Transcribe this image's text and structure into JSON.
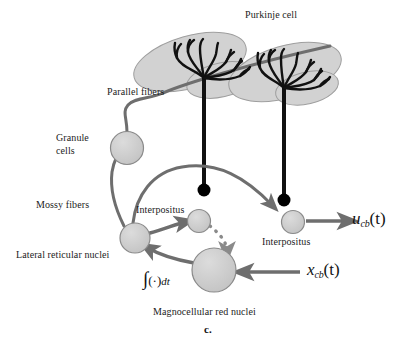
{
  "figure": {
    "panel_letter": "c.",
    "width": 412,
    "height": 344,
    "background": "#ffffff"
  },
  "colors": {
    "dendrite_fill": "#d2d2d2",
    "dendrite_stroke": "#9a9a9a",
    "neuron_fill": "#c9c9c9",
    "neuron_stroke": "#7a7a7a",
    "branch_stroke": "#111111",
    "axon_stroke": "#111111",
    "pathway_gray": "#6e6e6e",
    "terminal_black": "#000000",
    "text": "#1c1c1c"
  },
  "labels": {
    "purkinje_cell": "Purkinje cell",
    "parallel_fibers": "Parallel fibers",
    "granule_cells_line1": "Granule",
    "granule_cells_line2": "cells",
    "mossy_fibers": "Mossy fibers",
    "interpositus_left": "Interpositus",
    "interpositus_right": "Interpositus",
    "lateral_reticular_nuclei": "Lateral reticular nuclei",
    "magnocellular_red_nuclei": "Magnocellular red nuclei"
  },
  "math": {
    "output_signal_var": "u",
    "output_signal_sub": "cb",
    "output_signal_arg": "(t)",
    "input_signal_var": "x",
    "input_signal_sub": "cb",
    "input_signal_arg": "(t)",
    "integrator_prefix": "∫",
    "integrator_body": "(·)",
    "integrator_suffix": "dt"
  },
  "nodes": [
    {
      "id": "granule-cell",
      "label": "Granule cells",
      "cx": 127,
      "cy": 148,
      "r": 16.5
    },
    {
      "id": "lateral-reticular-nucleus",
      "label": "Lateral reticular nuclei",
      "cx": 135,
      "cy": 238,
      "r": 15
    },
    {
      "id": "interpositus-left",
      "label": "Interpositus",
      "cx": 199,
      "cy": 221,
      "r": 11.5
    },
    {
      "id": "interpositus-right",
      "label": "Interpositus",
      "cx": 293,
      "cy": 222,
      "r": 11.5
    },
    {
      "id": "magnocellular-red-nucleus",
      "label": "Magnocellular red nuclei",
      "cx": 214,
      "cy": 270,
      "r": 22
    },
    {
      "id": "purkinje-soma-left",
      "label": "Purkinje cell soma (left)",
      "cx": 204,
      "cy": 190,
      "r": 6
    },
    {
      "id": "purkinje-soma-right",
      "label": "Purkinje cell soma (right)",
      "cx": 284,
      "cy": 200,
      "r": 6
    }
  ],
  "connections": [
    {
      "id": "parallel-fiber",
      "from": "granule-cell",
      "to": "purkinje-dendrites",
      "style": "solid-gray"
    },
    {
      "id": "mossy-fiber-to-granule",
      "from": "lateral-reticular-nucleus",
      "to": "granule-cell",
      "style": "solid-gray"
    },
    {
      "id": "mossy-fiber-to-interpositus-right",
      "from": "lateral-reticular-nucleus",
      "to": "interpositus-right",
      "style": "solid-gray-arrow"
    },
    {
      "id": "lrn-to-interpositus-left",
      "from": "lateral-reticular-nucleus",
      "to": "interpositus-left",
      "style": "solid-gray-arrow"
    },
    {
      "id": "interpositus-left-to-red-nucleus",
      "from": "interpositus-left",
      "to": "magnocellular-red-nucleus",
      "style": "dotted-gray-arrow"
    },
    {
      "id": "red-nucleus-to-lrn",
      "from": "magnocellular-red-nucleus",
      "to": "lateral-reticular-nucleus",
      "style": "solid-gray-arrow"
    },
    {
      "id": "input-to-red-nucleus",
      "from": "x_cb(t)",
      "to": "magnocellular-red-nucleus",
      "style": "solid-gray-arrow"
    },
    {
      "id": "interpositus-right-to-output",
      "from": "interpositus-right",
      "to": "u_cb(t)",
      "style": "solid-gray-arrow"
    }
  ]
}
